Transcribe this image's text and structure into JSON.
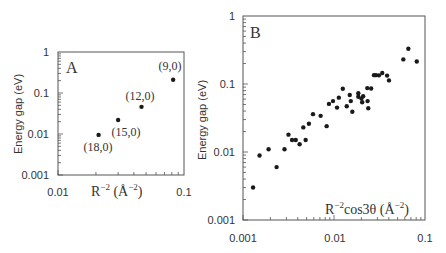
{
  "chart_data": [
    {
      "type": "scatter",
      "panel_label": "A",
      "title": "",
      "xlabel": "R^-2 (Å^-2)",
      "ylabel": "Energy gap (eV)",
      "xscale": "log",
      "yscale": "log",
      "xlim": [
        0.01,
        0.1
      ],
      "ylim": [
        0.001,
        1
      ],
      "x_ticks": [
        "0.01",
        "0.1"
      ],
      "y_ticks": [
        "0.001",
        "0.01",
        "0.1",
        "1"
      ],
      "grid": false,
      "points": [
        {
          "label": "(18,0)",
          "x": 0.021,
          "y": 0.0095
        },
        {
          "label": "(15,0)",
          "x": 0.03,
          "y": 0.022
        },
        {
          "label": "(12,0)",
          "x": 0.046,
          "y": 0.046
        },
        {
          "label": "(9,0)",
          "x": 0.082,
          "y": 0.21
        }
      ]
    },
    {
      "type": "scatter",
      "panel_label": "B",
      "title": "",
      "xlabel": "R^-2 cos3θ (Å^-2)",
      "ylabel": "Energy gap (eV)",
      "xscale": "log",
      "yscale": "log",
      "xlim": [
        0.001,
        0.1
      ],
      "ylim": [
        0.001,
        1
      ],
      "x_ticks": [
        "0.001",
        "0.01",
        "0.1"
      ],
      "y_ticks": [
        "0.001",
        "0.01",
        "0.1",
        "1"
      ],
      "grid": false,
      "points": [
        {
          "x": 0.00129,
          "y": 0.003
        },
        {
          "x": 0.00152,
          "y": 0.0089
        },
        {
          "x": 0.00191,
          "y": 0.011
        },
        {
          "x": 0.00234,
          "y": 0.006
        },
        {
          "x": 0.00286,
          "y": 0.011
        },
        {
          "x": 0.00316,
          "y": 0.018
        },
        {
          "x": 0.00346,
          "y": 0.015
        },
        {
          "x": 0.0038,
          "y": 0.015
        },
        {
          "x": 0.00419,
          "y": 0.013
        },
        {
          "x": 0.0046,
          "y": 0.023
        },
        {
          "x": 0.00488,
          "y": 0.015
        },
        {
          "x": 0.0053,
          "y": 0.026
        },
        {
          "x": 0.00588,
          "y": 0.036
        },
        {
          "x": 0.00713,
          "y": 0.034
        },
        {
          "x": 0.0083,
          "y": 0.024
        },
        {
          "x": 0.0088,
          "y": 0.051
        },
        {
          "x": 0.00975,
          "y": 0.056
        },
        {
          "x": 0.0108,
          "y": 0.045
        },
        {
          "x": 0.0113,
          "y": 0.063
        },
        {
          "x": 0.0125,
          "y": 0.085
        },
        {
          "x": 0.0138,
          "y": 0.047
        },
        {
          "x": 0.0149,
          "y": 0.069
        },
        {
          "x": 0.0153,
          "y": 0.056
        },
        {
          "x": 0.0159,
          "y": 0.039
        },
        {
          "x": 0.0185,
          "y": 0.065
        },
        {
          "x": 0.0185,
          "y": 0.073
        },
        {
          "x": 0.02,
          "y": 0.061
        },
        {
          "x": 0.0204,
          "y": 0.054
        },
        {
          "x": 0.0209,
          "y": 0.066
        },
        {
          "x": 0.0232,
          "y": 0.087
        },
        {
          "x": 0.0234,
          "y": 0.056
        },
        {
          "x": 0.0238,
          "y": 0.044
        },
        {
          "x": 0.0256,
          "y": 0.086
        },
        {
          "x": 0.0275,
          "y": 0.135
        },
        {
          "x": 0.0289,
          "y": 0.135
        },
        {
          "x": 0.0312,
          "y": 0.134
        },
        {
          "x": 0.0339,
          "y": 0.145
        },
        {
          "x": 0.0383,
          "y": 0.133
        },
        {
          "x": 0.0402,
          "y": 0.113
        },
        {
          "x": 0.0578,
          "y": 0.23
        },
        {
          "x": 0.0656,
          "y": 0.33
        },
        {
          "x": 0.0812,
          "y": 0.214
        }
      ]
    }
  ],
  "panelA": {
    "label": "A",
    "ylabel": "Energy gap (eV)",
    "xlabel_base": "R",
    "xlabel_exp": "−2",
    "xlabel_unit_open": " (Å",
    "xlabel_unit_exp": "−2",
    "xlabel_unit_close": ")",
    "yticks": [
      "1",
      "0.1",
      "0.01",
      "0.001"
    ],
    "xticks": [
      "0.01",
      "0.1"
    ],
    "annotations": [
      "(18,0)",
      "(15,0)",
      "(12,0)",
      "(9,0)"
    ]
  },
  "panelB": {
    "label": "B",
    "ylabel": "Energy gap (eV)",
    "xlabel_base": "R",
    "xlabel_exp": "−2",
    "xlabel_mid": "cos3θ (Å",
    "xlabel_unit_exp": "−2",
    "xlabel_unit_close": ")",
    "yticks": [
      "1",
      "0.1",
      "0.01",
      "0.001"
    ],
    "xticks": [
      "0.001",
      "0.01",
      "0.1"
    ]
  }
}
